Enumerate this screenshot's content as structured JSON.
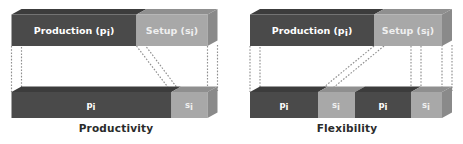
{
  "figure": {
    "type": "diagram",
    "background_color": "#ffffff"
  },
  "colors": {
    "production_front": "#4a4a4a",
    "production_top": "#3c3c3c",
    "production_side": "#2f2f2f",
    "setup_front": "#a8a8a8",
    "setup_top": "#9a9a9a",
    "setup_side": "#868686",
    "dotted_line": "#8a8a8a",
    "caption_text": "#2b2b2b",
    "label_text": "#ffffff"
  },
  "panels": [
    {
      "id": "productivity",
      "caption": "Productivity",
      "top_bar": {
        "segments": [
          {
            "id": "production",
            "label": "Production (p",
            "sub": "i",
            "label_tail": ")",
            "kind": "production",
            "width_pct": 72
          },
          {
            "id": "setup",
            "label": "Setup (s",
            "sub": "i",
            "label_tail": ")",
            "kind": "setup",
            "width_pct": 28
          }
        ]
      },
      "bottom_bar": {
        "segments": [
          {
            "id": "p1",
            "label": "p",
            "sub": "i",
            "kind": "production",
            "width_pct": 80
          },
          {
            "id": "s1",
            "label": "s",
            "sub": "i",
            "kind": "setup",
            "width_pct": 20
          }
        ]
      }
    },
    {
      "id": "flexibility",
      "caption": "Flexibility",
      "top_bar": {
        "segments": [
          {
            "id": "production",
            "label": "Production (p",
            "sub": "i",
            "label_tail": ")",
            "kind": "production",
            "width_pct": 68
          },
          {
            "id": "setup",
            "label": "Setup (s",
            "sub": "i",
            "label_tail": ")",
            "kind": "setup",
            "width_pct": 32
          }
        ]
      },
      "bottom_bar": {
        "segments": [
          {
            "id": "p1",
            "label": "p",
            "sub": "i",
            "kind": "production",
            "width_pct": 33
          },
          {
            "id": "s1",
            "label": "s",
            "sub": "i",
            "kind": "setup",
            "width_pct": 17
          },
          {
            "id": "p2",
            "label": "p",
            "sub": "i",
            "kind": "production",
            "width_pct": 33
          },
          {
            "id": "s2",
            "label": "s",
            "sub": "i",
            "kind": "setup",
            "width_pct": 17
          }
        ]
      }
    }
  ],
  "labels": {
    "production_full": "Production (pi)",
    "setup_full": "Setup (si)",
    "p_short": "pi",
    "s_short": "si",
    "caption_left": "Productivity",
    "caption_right": "Flexibility"
  }
}
